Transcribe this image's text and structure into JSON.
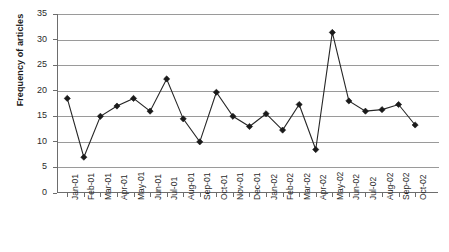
{
  "chart_data": {
    "type": "line",
    "title": "",
    "xlabel": "",
    "ylabel": "Frequency of articles",
    "ylim": [
      0,
      35
    ],
    "ytick_step": 5,
    "yticks": [
      "0",
      "5",
      "10",
      "15",
      "20",
      "25",
      "30",
      "35"
    ],
    "grid": true,
    "legend": "none",
    "marker": "diamond",
    "line_color": "#262626",
    "marker_color": "#1a1a1a",
    "grid_color": "#9a9a9a",
    "categories": [
      "Jan-01",
      "Feb-01",
      "Mar-01",
      "Apr-01",
      "May-01",
      "Jun-01",
      "Jul-01",
      "Aug-01",
      "Sep-01",
      "Oct-01",
      "Nov-01",
      "Dec-01",
      "Jan-02",
      "Feb-02",
      "Mar-02",
      "Apr-02",
      "May-02",
      "Jun-02",
      "Jul-02",
      "Aug-02",
      "Sep-02",
      "Oct-02"
    ],
    "values": [
      18.5,
      7.0,
      15.0,
      17.0,
      18.5,
      16.0,
      22.3,
      14.5,
      10.0,
      19.7,
      15.0,
      13.0,
      15.5,
      12.3,
      17.3,
      8.5,
      31.4,
      18.0,
      16.0,
      16.3,
      17.3,
      13.3
    ]
  }
}
